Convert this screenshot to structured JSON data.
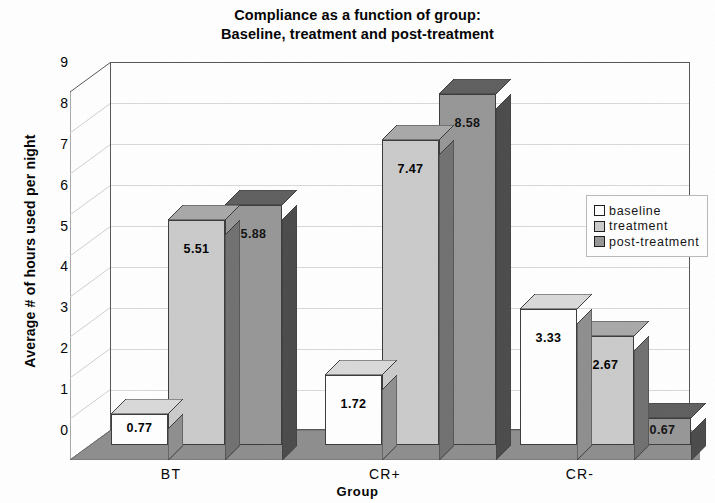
{
  "chart_data": {
    "type": "bar",
    "title": "Compliance as a function of group: Baseline, treatment and post-treatment",
    "title_line1": "Compliance as a function of group:",
    "title_line2": "Baseline, treatment and post-treatment",
    "xlabel": "Group",
    "ylabel": "Average # of hours used per night",
    "categories": [
      "BT",
      "CR+",
      "CR-"
    ],
    "series": [
      {
        "name": "baseline",
        "values": [
          0.77,
          1.72,
          3.33
        ],
        "color": "#ffffff"
      },
      {
        "name": "treatment",
        "values": [
          5.51,
          7.47,
          2.67
        ],
        "color": "#cacaca"
      },
      {
        "name": "post-treatment",
        "values": [
          5.88,
          8.58,
          0.67
        ],
        "color": "#969696"
      }
    ],
    "value_labels": [
      [
        "0.77",
        "5.51",
        "5.88"
      ],
      [
        "1.72",
        "7.47",
        "8.58"
      ],
      [
        "3.33",
        "2.67",
        "0.67"
      ]
    ],
    "ylim": [
      0,
      9
    ],
    "yticks": [
      "9",
      "8",
      "7",
      "6",
      "5",
      "4",
      "3",
      "2",
      "1",
      "0"
    ],
    "grid": true,
    "legend_position": "right-inside",
    "style": "3d-column"
  },
  "legend": {
    "items": [
      {
        "label": "baseline"
      },
      {
        "label": "treatment"
      },
      {
        "label": "post-treatment"
      }
    ]
  },
  "colors": {
    "baseline_face": "#ffffff",
    "treatment_face": "#cacaca",
    "post_treatment_face": "#969696",
    "baseline_side": "#8e8e8e",
    "treatment_side": "#707070",
    "post_treatment_side": "#4a4a4a",
    "baseline_top": "#d9d9d9",
    "treatment_top": "#a8a8a8",
    "post_treatment_top": "#5e5e5e",
    "floor": "#8d8d8d",
    "back_wall": "#ffffff",
    "gridline": "#d8d8d8",
    "axis_line": "#555555"
  }
}
